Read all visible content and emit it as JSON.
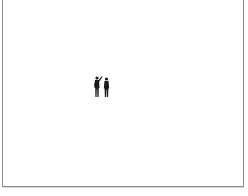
{
  "image": {
    "description": "Two silhouetted human figures standing on a white background, one pointing upward",
    "subjects": [
      {
        "name": "figure-pointing",
        "pose": "arm raised pointing up-right"
      },
      {
        "name": "figure-standing",
        "pose": "standing upright"
      }
    ],
    "colors": {
      "background": "#ffffff",
      "frame": "#8a8a8a",
      "figures": "#1a1a1a"
    }
  }
}
